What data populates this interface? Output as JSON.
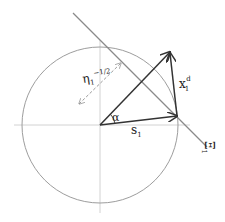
{
  "diagram": {
    "labels": {
      "eta": "η",
      "eta_sub": "1",
      "eta_sup": "−1/2",
      "x": "x",
      "x_sub": "1",
      "x_sup": "d",
      "alpha": "α",
      "s": "s",
      "s_sub": "1",
      "xi": "Ξ",
      "xi_sub": "1"
    },
    "elements": {
      "circle": {
        "cx": 100,
        "cy": 125,
        "r": 78
      },
      "origin": [
        100,
        125
      ],
      "vector_s1_tip": [
        177,
        116
      ],
      "vector_diag_tip": [
        170,
        52
      ],
      "hyperplane": {
        "from": [
          73,
          13
        ],
        "to": [
          207,
          147
        ]
      },
      "dashed_arrow": {
        "from": [
          121,
          63
        ],
        "to": [
          79,
          104
        ]
      }
    },
    "colors": {
      "axis": "#cfcfcf",
      "circle": "#9a9a9a",
      "line": "#8a8a8a",
      "vector": "#333333",
      "dashed": "#9a9a9a"
    }
  }
}
